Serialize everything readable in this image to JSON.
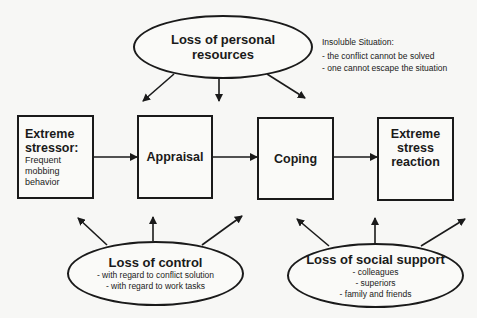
{
  "top_factor": {
    "title": "Loss of personal resources"
  },
  "note": {
    "title": "Insoluble  Situation:",
    "items": [
      "- the conflict cannot be solved",
      "- one cannot escape the situation"
    ]
  },
  "process": [
    {
      "title": "Extreme stressor:",
      "detail": "Frequent mobbing behavior"
    },
    {
      "title": "Appraisal"
    },
    {
      "title": "Coping"
    },
    {
      "title": "Extreme stress reaction"
    }
  ],
  "bottom_left_factor": {
    "title": "Loss of control",
    "items": [
      "- with regard to conflict solution",
      "- with regard to work tasks"
    ]
  },
  "bottom_right_factor": {
    "title": "Loss of social support",
    "items": [
      "- colleagues",
      "- superiors",
      "- family and friends"
    ]
  }
}
